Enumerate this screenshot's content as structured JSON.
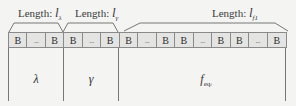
{
  "diagram": {
    "title": "",
    "segments": [
      {
        "id": "lambda",
        "length_label_prefix": "Length:",
        "length_var": "l",
        "length_sub": "λ",
        "section_symbol": "λ",
        "section_sub": "",
        "cells": [
          "B",
          "...",
          "B"
        ]
      },
      {
        "id": "gamma",
        "length_label_prefix": "Length:",
        "length_var": "l",
        "length_sub": "γ",
        "section_symbol": "γ",
        "section_sub": "",
        "cells": [
          "B",
          "...",
          "B"
        ]
      },
      {
        "id": "f_eq",
        "length_label_prefix": "Length:",
        "length_var": "l",
        "length_sub": "f1",
        "section_symbol": "f",
        "section_sub": "eq",
        "section_sub_index": "i",
        "cells": [
          "B",
          "...",
          "B",
          "B",
          "...",
          "B",
          "B",
          "...",
          "B"
        ]
      }
    ],
    "cell_labels": [
      "B",
      "...",
      "B",
      "B",
      "...",
      "B",
      "B",
      "...",
      "B",
      "B",
      "...",
      "B",
      "B",
      "...",
      "B"
    ],
    "colors": {
      "background": "#f4f4f2",
      "cell_fill": "#e4e4e2",
      "line": "#8a8a8a",
      "text": "#333333"
    }
  }
}
